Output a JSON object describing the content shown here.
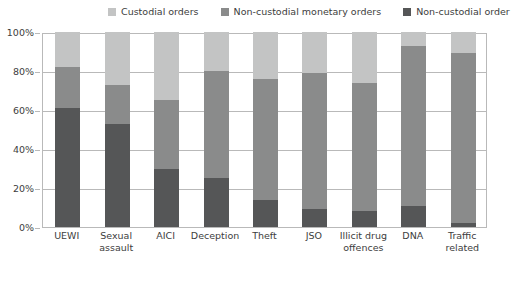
{
  "chart_data": {
    "type": "bar",
    "subtype": "stacked-bar-100-percent",
    "title": "",
    "subtitle": "",
    "xlabel": "",
    "ylabel": "",
    "ylim": [
      0,
      100
    ],
    "ytick_labels": [
      "0%",
      "20%",
      "40%",
      "60%",
      "80%",
      "100%"
    ],
    "ytick_values": [
      0,
      20,
      40,
      60,
      80,
      100
    ],
    "grid": true,
    "legend_position": "top",
    "categories": [
      "UEWI",
      "Sexual assault",
      "AICI",
      "Deception",
      "Theft",
      "JSO",
      "Illicit drug offences",
      "DNA",
      "Traffic related"
    ],
    "series": [
      {
        "name": "Non-custodial order",
        "color": "#555657",
        "values": [
          61,
          53,
          30,
          25,
          14,
          9,
          8,
          11,
          2
        ]
      },
      {
        "name": "Non-custodial monetary orders",
        "color": "#8a8b8b",
        "values": [
          21,
          20,
          35,
          55,
          62,
          70,
          66,
          82,
          87
        ]
      },
      {
        "name": "Custodial orders",
        "color": "#c3c4c4",
        "values": [
          18,
          27,
          35,
          20,
          24,
          21,
          26,
          7,
          11
        ]
      }
    ]
  },
  "legend": {
    "items": [
      {
        "label": "Custodial orders",
        "color": "#c3c4c4"
      },
      {
        "label": "Non-custodial monetary orders",
        "color": "#8a8b8b"
      },
      {
        "label": "Non-custodial order",
        "color": "#555657"
      }
    ]
  },
  "colors": {
    "custodial": "#c3c4c4",
    "non_custodial_monetary": "#8a8b8b",
    "non_custodial": "#555657",
    "grid": "#b9b9b9",
    "text": "#3d3d3d",
    "background": "#ffffff"
  }
}
